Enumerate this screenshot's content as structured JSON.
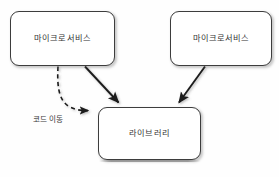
{
  "diagram": {
    "background_color": "#fefefe",
    "node_border_color": "#3d3d3d",
    "node_fill_color": "#ffffff",
    "text_color": "#333333",
    "edge_color": "#1a1a1a",
    "nodes": [
      {
        "id": "microservice-left",
        "label": "마이크로서비스",
        "shape": "rounded-rectangle",
        "x": 10,
        "y": 11,
        "width": 105,
        "height": 55
      },
      {
        "id": "microservice-right",
        "label": "마이크로서비스",
        "shape": "rounded-rectangle",
        "x": 170,
        "y": 11,
        "width": 102,
        "height": 55
      },
      {
        "id": "library",
        "label": "라이브러리",
        "shape": "rounded-rectangle",
        "x": 98,
        "y": 107,
        "width": 103,
        "height": 53
      }
    ],
    "edges": [
      {
        "id": "edge-left-to-library",
        "from": "microservice-left",
        "to": "library",
        "style": "solid",
        "arrowhead": "filled-triangle",
        "label": ""
      },
      {
        "id": "edge-right-to-library",
        "from": "microservice-right",
        "to": "library",
        "style": "solid",
        "arrowhead": "filled-triangle",
        "label": ""
      },
      {
        "id": "edge-code-move",
        "from": "microservice-left",
        "to": "library",
        "style": "dashed",
        "arrowhead": "filled-triangle",
        "label": "코드 이동"
      }
    ]
  }
}
